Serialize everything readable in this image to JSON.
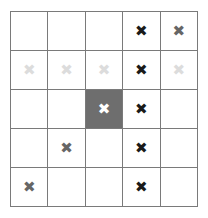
{
  "figure": {
    "name": "five-by-five-mark-grid",
    "rows": 5,
    "columns": 5,
    "mark_glyph": "✖",
    "colors": {
      "grid_line": "#7a7a7a",
      "cell_background": "#ffffff",
      "highlight_background": "#6e6e6e",
      "mark_black": "#1a1a1a",
      "mark_gray": "#666666",
      "mark_light": "#dcdcdc",
      "mark_white": "#ffffff"
    },
    "cells": [
      [
        {
          "mark": "",
          "tone": "empty",
          "highlight": false
        },
        {
          "mark": "",
          "tone": "empty",
          "highlight": false
        },
        {
          "mark": "",
          "tone": "empty",
          "highlight": false
        },
        {
          "mark": "✖",
          "tone": "black",
          "highlight": false
        },
        {
          "mark": "✖",
          "tone": "gray",
          "highlight": false
        }
      ],
      [
        {
          "mark": "✖",
          "tone": "light",
          "highlight": false
        },
        {
          "mark": "✖",
          "tone": "light",
          "highlight": false
        },
        {
          "mark": "✖",
          "tone": "light",
          "highlight": false
        },
        {
          "mark": "✖",
          "tone": "black",
          "highlight": false
        },
        {
          "mark": "✖",
          "tone": "light",
          "highlight": false
        }
      ],
      [
        {
          "mark": "",
          "tone": "empty",
          "highlight": false
        },
        {
          "mark": "",
          "tone": "empty",
          "highlight": false
        },
        {
          "mark": "✖",
          "tone": "white",
          "highlight": true
        },
        {
          "mark": "✖",
          "tone": "black",
          "highlight": false
        },
        {
          "mark": "",
          "tone": "empty",
          "highlight": false
        }
      ],
      [
        {
          "mark": "",
          "tone": "empty",
          "highlight": false
        },
        {
          "mark": "✖",
          "tone": "gray",
          "highlight": false
        },
        {
          "mark": "",
          "tone": "empty",
          "highlight": false
        },
        {
          "mark": "✖",
          "tone": "black",
          "highlight": false
        },
        {
          "mark": "",
          "tone": "empty",
          "highlight": false
        }
      ],
      [
        {
          "mark": "✖",
          "tone": "gray",
          "highlight": false
        },
        {
          "mark": "",
          "tone": "empty",
          "highlight": false
        },
        {
          "mark": "",
          "tone": "empty",
          "highlight": false
        },
        {
          "mark": "✖",
          "tone": "black",
          "highlight": false
        },
        {
          "mark": "",
          "tone": "empty",
          "highlight": false
        }
      ]
    ]
  }
}
